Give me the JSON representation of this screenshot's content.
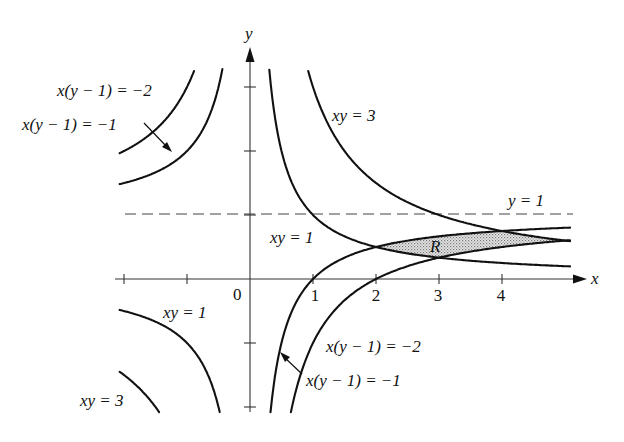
{
  "chart_data": {
    "type": "diagram",
    "title": "",
    "axes": {
      "x_label": "x",
      "y_label": "y",
      "origin_label": "0",
      "x_ticks": [
        -2,
        -1,
        1,
        2,
        3,
        4
      ],
      "x_tick_labels": [
        "1",
        "2",
        "3",
        "4"
      ],
      "y_ticks": [
        -2,
        -1,
        1,
        2,
        3
      ],
      "xlim": [
        -2.0,
        5.2
      ],
      "ylim": [
        -2.1,
        3.3
      ]
    },
    "asymptote": {
      "equation": "y = 1",
      "value": 1,
      "style": "dashed"
    },
    "curves": [
      {
        "id": "xy1",
        "equation": "xy = 1",
        "formula": "y = 1/x",
        "branches": "Q1 and Q3"
      },
      {
        "id": "xy3",
        "equation": "xy = 3",
        "formula": "y = 3/x",
        "branches": "Q1 and Q3"
      },
      {
        "id": "xym1",
        "equation": "x(y-1) = -1",
        "formula": "y = 1 - 1/x",
        "branches": "x<0 upper-left and x>0"
      },
      {
        "id": "xym2",
        "equation": "x(y-1) = -2",
        "formula": "y = 1 - 2/x",
        "branches": "x<0 upper-left and x>0"
      }
    ],
    "shaded_region": {
      "label": "R",
      "bounded_by": [
        "xy = 1",
        "xy = 3",
        "x(y-1) = -1",
        "x(y-1) = -2"
      ],
      "vertices": [
        [
          2,
          0.5
        ],
        [
          3,
          0.333
        ],
        [
          5,
          0.6
        ],
        [
          4,
          0.75
        ]
      ]
    }
  },
  "labels": {
    "y_axis": "y",
    "x_axis": "x",
    "origin": "0",
    "tick_1": "1",
    "tick_2": "2",
    "tick_3": "3",
    "tick_4": "4",
    "asymptote": "y = 1",
    "q1_xy3": "xy = 3",
    "q1_xy1": "xy = 1",
    "q3_xy1": "xy = 1",
    "q3_xy3": "xy = 3",
    "ul_xym2": "x(y − 1) = −2",
    "ul_xym1": "x(y − 1) = −1",
    "lr_xym2": "x(y − 1) = −2",
    "lr_xym1": "x(y − 1) = −1",
    "region": "R"
  },
  "colors": {
    "ink": "#111111",
    "region_fill": "#cfcfcf"
  }
}
